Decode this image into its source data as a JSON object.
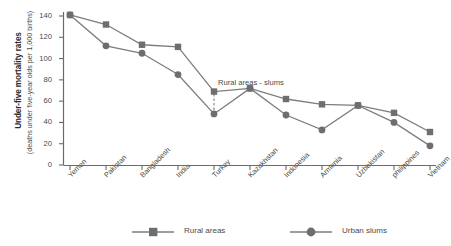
{
  "chart_data": {
    "type": "line",
    "title": "",
    "ylabel_main": "Under-five mortality rates",
    "ylabel_sub": "(deaths under five-year olds per 1,000 births)",
    "xlabel": "",
    "categories": [
      "Yemen",
      "Pakistan",
      "Bangladesh",
      "India",
      "Turkey",
      "Kazakhstan",
      "Indonesia",
      "Armenia",
      "Uzbekistan",
      "philippines",
      "Vietnam"
    ],
    "series": [
      {
        "name": "Rural areas",
        "marker": "square",
        "color": "#7d7d7d",
        "values": [
          141,
          132,
          113,
          111,
          69,
          72,
          62,
          57,
          56,
          49,
          31
        ]
      },
      {
        "name": "Urban slums",
        "marker": "circle",
        "color": "#7d7d7d",
        "values": [
          141,
          112,
          105,
          85,
          48,
          72,
          47,
          33,
          56,
          40,
          18
        ]
      }
    ],
    "ylim": [
      0,
      140
    ],
    "yticks": [
      0,
      20,
      40,
      60,
      80,
      100,
      120,
      140
    ],
    "ytick_labels": [
      "0",
      "20",
      "40",
      "60",
      "80",
      "100",
      "120",
      "140"
    ],
    "grid": false,
    "legend_position": "bottom",
    "annotations": [
      {
        "text": "Rural areas - slums",
        "at_category": "Turkey",
        "style": "dashed-vertical-line"
      }
    ]
  },
  "legend": {
    "items": [
      {
        "label": "Rural areas",
        "marker": "square-marker-icon"
      },
      {
        "label": "Urban slums",
        "marker": "circle-marker-icon"
      }
    ]
  },
  "colors": {
    "line": "#7d7d7d",
    "marker": "#6e6e6e",
    "axis": "#6b6b6b",
    "text": "#4a4a4a",
    "background": "#ffffff"
  }
}
